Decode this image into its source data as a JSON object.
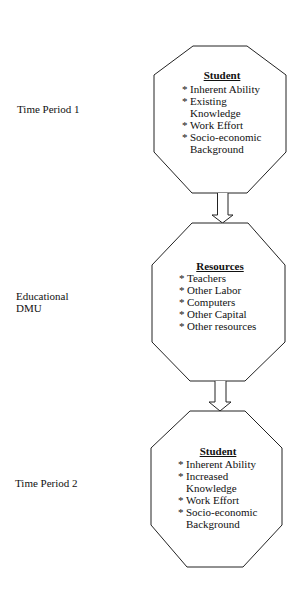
{
  "labels": {
    "period1": "Time Period 1",
    "dmu_line1": "Educational",
    "dmu_line2": "DMU",
    "period2": "Time Period 2"
  },
  "boxes": {
    "student1": {
      "title": "Student",
      "items": [
        {
          "bullet": "*",
          "text": "Inherent Ability"
        },
        {
          "bullet": "*",
          "text": "Existing"
        },
        {
          "bullet": "",
          "text": "Knowledge"
        },
        {
          "bullet": "*",
          "text": "Work Effort"
        },
        {
          "bullet": "*",
          "text": "Socio-economic"
        },
        {
          "bullet": "",
          "text": "Background"
        }
      ]
    },
    "resources": {
      "title": "Resources",
      "items": [
        {
          "bullet": "*",
          "text": "Teachers"
        },
        {
          "bullet": "*",
          "text": "Other Labor"
        },
        {
          "bullet": "*",
          "text": "Computers"
        },
        {
          "bullet": "*",
          "text": "Other Capital"
        },
        {
          "bullet": "*",
          "text": "Other resources"
        }
      ]
    },
    "student2": {
      "title": "Student",
      "items": [
        {
          "bullet": "*",
          "text": "Inherent Ability"
        },
        {
          "bullet": "*",
          "text": "Increased"
        },
        {
          "bullet": "",
          "text": "Knowledge"
        },
        {
          "bullet": "*",
          "text": "Work Effort"
        },
        {
          "bullet": "*",
          "text": "Socio-economic"
        },
        {
          "bullet": "",
          "text": "Background"
        }
      ]
    }
  },
  "colors": {
    "stroke": "#222222",
    "text": "#111111",
    "background": "#ffffff"
  }
}
